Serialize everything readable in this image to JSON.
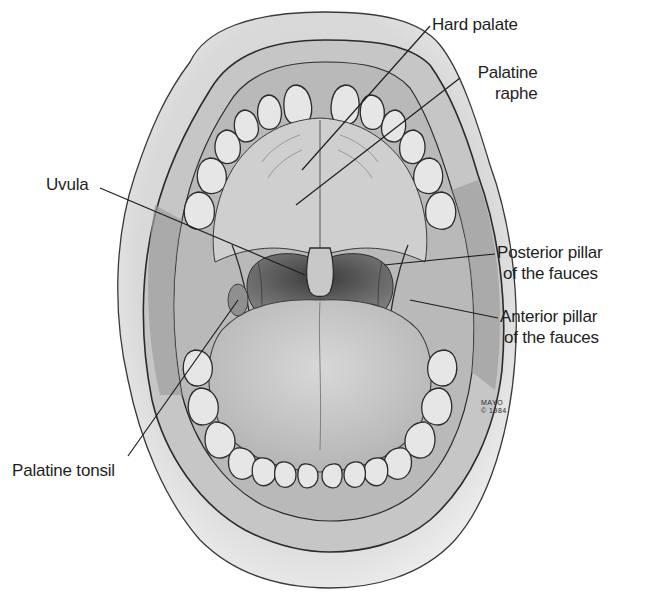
{
  "figure": {
    "credit": {
      "line1": "MAYO",
      "line2": "© 1984"
    }
  },
  "labels": [
    {
      "id": "hard-palate",
      "lines": [
        "Hard palate"
      ]
    },
    {
      "id": "palatine-raphe",
      "lines": [
        "Palatine",
        "raphe"
      ]
    },
    {
      "id": "uvula",
      "lines": [
        "Uvula"
      ]
    },
    {
      "id": "posterior-pillar",
      "lines": [
        "Posterior pillar",
        "of the fauces"
      ]
    },
    {
      "id": "anterior-pillar",
      "lines": [
        "Anterior pillar",
        "of the fauces"
      ]
    },
    {
      "id": "palatine-tonsil",
      "lines": [
        "Palatine tonsil"
      ]
    }
  ],
  "colors": {
    "background": "#ffffff",
    "skin": "#d6d6d6",
    "lip": "#c4c4c4",
    "gum": "#bdbdbd",
    "tooth": "#e6e6e6",
    "palate": "#cfcfcf",
    "throat": "#5a5a5a",
    "tongue": "#c9c9c9",
    "outline": "#2b2b2b",
    "text": "#1e1e1e"
  }
}
